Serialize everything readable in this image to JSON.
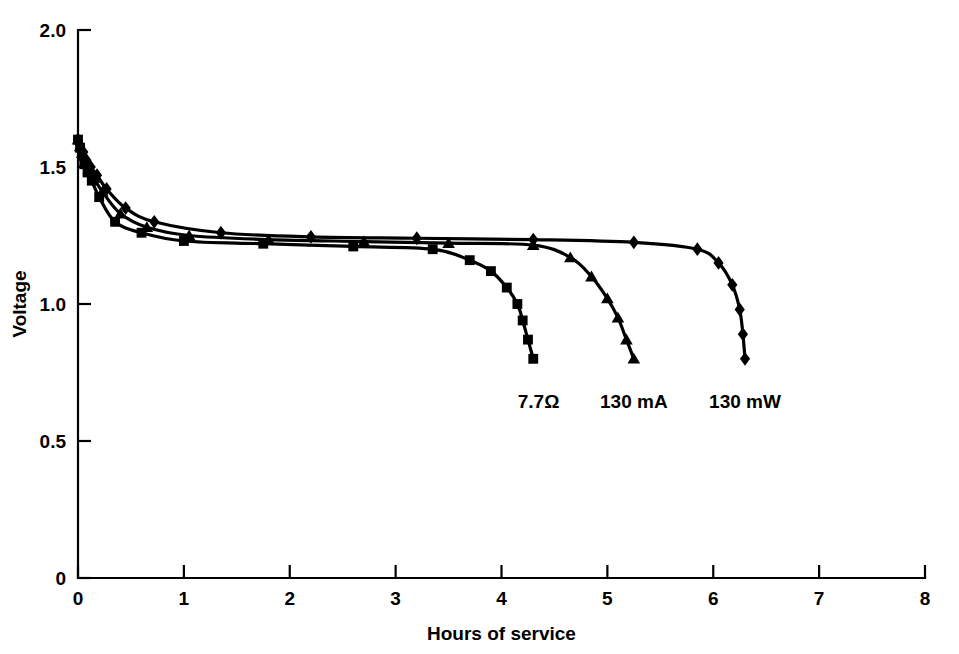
{
  "chart_data": {
    "type": "line",
    "title": "",
    "subtitle": "",
    "xlabel": "Hours of service",
    "ylabel": "Voltage",
    "xlim": [
      0,
      8
    ],
    "ylim": [
      0,
      2.0
    ],
    "xticks": [
      "0",
      "1",
      "2",
      "3",
      "4",
      "5",
      "6",
      "7",
      "8"
    ],
    "xtick_values": [
      0,
      1,
      2,
      3,
      4,
      5,
      6,
      7,
      8
    ],
    "yticks": [
      "0",
      "0.5",
      "1.0",
      "1.5",
      "2.0"
    ],
    "ytick_values": [
      0,
      0.5,
      1.0,
      1.5,
      2.0
    ],
    "grid": false,
    "legend_position": "inline-annotations",
    "line_color": "#000000",
    "background_color": "#ffffff",
    "series": [
      {
        "name": "7.7Ω",
        "marker": "square",
        "label_x": 4.35,
        "label_y": 0.62,
        "x": [
          0.0,
          0.02,
          0.04,
          0.06,
          0.09,
          0.13,
          0.2,
          0.35,
          0.6,
          1.0,
          1.75,
          2.6,
          3.35,
          3.7,
          3.9,
          4.05,
          4.15,
          4.2,
          4.25,
          4.3
        ],
        "y": [
          1.6,
          1.57,
          1.54,
          1.51,
          1.48,
          1.45,
          1.39,
          1.3,
          1.26,
          1.23,
          1.22,
          1.21,
          1.2,
          1.16,
          1.12,
          1.06,
          1.0,
          0.94,
          0.87,
          0.8
        ]
      },
      {
        "name": "130 mA",
        "marker": "triangle",
        "label_x": 5.25,
        "label_y": 0.62,
        "x": [
          0.0,
          0.02,
          0.04,
          0.07,
          0.1,
          0.15,
          0.23,
          0.4,
          0.65,
          1.05,
          1.8,
          2.7,
          3.5,
          4.3,
          4.65,
          4.85,
          5.0,
          5.1,
          5.18,
          5.25
        ],
        "y": [
          1.6,
          1.575,
          1.55,
          1.52,
          1.49,
          1.46,
          1.41,
          1.33,
          1.28,
          1.25,
          1.235,
          1.228,
          1.222,
          1.215,
          1.17,
          1.1,
          1.02,
          0.95,
          0.87,
          0.8
        ]
      },
      {
        "name": "130 mW",
        "marker": "diamond",
        "label_x": 6.3,
        "label_y": 0.62,
        "x": [
          0.0,
          0.02,
          0.05,
          0.08,
          0.12,
          0.18,
          0.27,
          0.45,
          0.72,
          1.35,
          2.2,
          3.2,
          4.3,
          5.25,
          5.85,
          6.05,
          6.18,
          6.25,
          6.28,
          6.3
        ],
        "y": [
          1.6,
          1.58,
          1.555,
          1.525,
          1.5,
          1.47,
          1.42,
          1.35,
          1.3,
          1.26,
          1.245,
          1.24,
          1.235,
          1.225,
          1.2,
          1.15,
          1.07,
          0.98,
          0.89,
          0.8
        ]
      }
    ]
  }
}
